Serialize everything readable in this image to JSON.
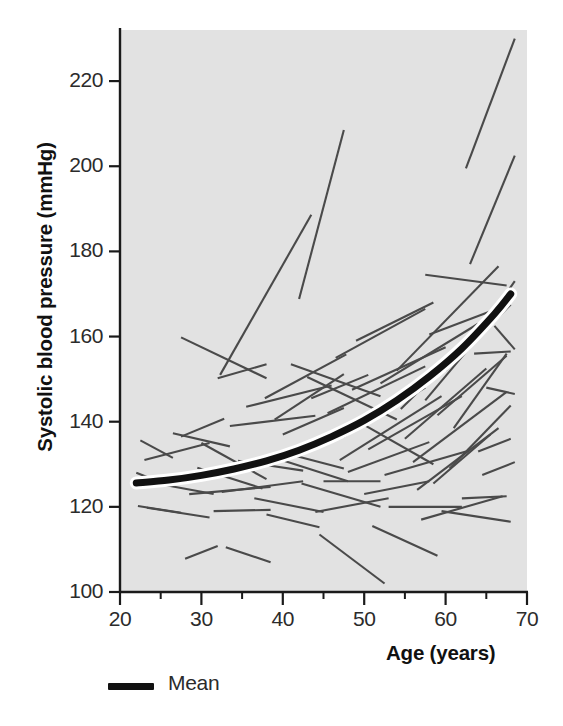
{
  "chart_data": {
    "type": "line",
    "title": "",
    "subtitle": "",
    "xlabel": "Age (years)",
    "ylabel": "Systolic blood pressure (mmHg)",
    "xlim": [
      20,
      70
    ],
    "ylim": [
      100,
      232
    ],
    "xticks": [
      20,
      30,
      40,
      50,
      60,
      70
    ],
    "xminorticks": [
      25,
      35,
      45,
      55,
      65
    ],
    "yticks": [
      100,
      120,
      140,
      160,
      180,
      200,
      220
    ],
    "grid": false,
    "legend": {
      "position": "below-left",
      "entries": [
        {
          "name": "Mean",
          "style": "thick-black-line",
          "color": "#111111"
        }
      ]
    },
    "plot_background": "#e2e2e2",
    "series_color": "#4a4a4a",
    "mean_color": "#111111",
    "mean_halo_color": "#ffffff",
    "series_description": "Individual subject systolic blood pressure trajectories (spaghetti plot), each a straight segment from first to last observation",
    "mean": {
      "name": "Mean",
      "x": [
        22,
        26,
        30,
        34,
        38,
        42,
        46,
        50,
        54,
        58,
        62,
        66,
        68
      ],
      "y": [
        125.6,
        126.3,
        127.4,
        128.9,
        130.8,
        133.3,
        136.5,
        140.3,
        145.0,
        150.6,
        157.2,
        165.3,
        170.0
      ]
    },
    "subjects": [
      {
        "x": [
          22.0,
          26.0
        ],
        "y": [
          128.0,
          125.0
        ]
      },
      {
        "x": [
          22.2,
          27.5
        ],
        "y": [
          120.2,
          118.6
        ]
      },
      {
        "x": [
          22.5,
          26.5
        ],
        "y": [
          135.6,
          131.5
        ]
      },
      {
        "x": [
          23.0,
          31.0
        ],
        "y": [
          131.0,
          135.0
        ]
      },
      {
        "x": [
          23.3,
          31.0
        ],
        "y": [
          119.8,
          117.5
        ]
      },
      {
        "x": [
          24.5,
          31.5
        ],
        "y": [
          125.5,
          123.0
        ]
      },
      {
        "x": [
          26.5,
          33.5
        ],
        "y": [
          137.3,
          134.2
        ]
      },
      {
        "x": [
          27.5,
          38.0
        ],
        "y": [
          159.8,
          150.2
        ]
      },
      {
        "x": [
          27.5,
          32.8
        ],
        "y": [
          136.5,
          140.7
        ]
      },
      {
        "x": [
          28.0,
          32.0
        ],
        "y": [
          107.8,
          110.8
        ]
      },
      {
        "x": [
          28.5,
          38.5
        ],
        "y": [
          123.0,
          124.7
        ]
      },
      {
        "x": [
          29.5,
          37.5
        ],
        "y": [
          129.2,
          124.3
        ]
      },
      {
        "x": [
          30.0,
          38.0
        ],
        "y": [
          135.0,
          126.5
        ]
      },
      {
        "x": [
          31.5,
          38.5
        ],
        "y": [
          119.0,
          119.3
        ]
      },
      {
        "x": [
          32.0,
          38.0
        ],
        "y": [
          150.2,
          153.5
        ]
      },
      {
        "x": [
          32.3,
          43.5
        ],
        "y": [
          151.0,
          188.6
        ]
      },
      {
        "x": [
          32.5,
          42.5
        ],
        "y": [
          123.5,
          126.0
        ]
      },
      {
        "x": [
          33.0,
          38.5
        ],
        "y": [
          110.5,
          107.0
        ]
      },
      {
        "x": [
          33.5,
          44.0
        ],
        "y": [
          139.0,
          141.4
        ]
      },
      {
        "x": [
          34.5,
          42.5
        ],
        "y": [
          130.8,
          128.5
        ]
      },
      {
        "x": [
          35.5,
          46.0
        ],
        "y": [
          143.5,
          148.5
        ]
      },
      {
        "x": [
          36.5,
          45.0
        ],
        "y": [
          122.0,
          118.8
        ]
      },
      {
        "x": [
          37.8,
          47.8
        ],
        "y": [
          145.5,
          155.8
        ]
      },
      {
        "x": [
          38.0,
          44.5
        ],
        "y": [
          118.2,
          115.2
        ]
      },
      {
        "x": [
          38.5,
          48.0
        ],
        "y": [
          131.8,
          126.0
        ]
      },
      {
        "x": [
          39.0,
          47.5
        ],
        "y": [
          140.5,
          151.2
        ]
      },
      {
        "x": [
          40.0,
          47.5
        ],
        "y": [
          137.0,
          143.2
        ]
      },
      {
        "x": [
          41.0,
          52.0
        ],
        "y": [
          153.5,
          146.0
        ]
      },
      {
        "x": [
          41.5,
          47.5
        ],
        "y": [
          132.0,
          129.0
        ]
      },
      {
        "x": [
          42.0,
          47.5
        ],
        "y": [
          168.8,
          208.5
        ]
      },
      {
        "x": [
          42.3,
          52.0
        ],
        "y": [
          125.5,
          120.0
        ]
      },
      {
        "x": [
          43.0,
          54.0
        ],
        "y": [
          150.5,
          140.5
        ]
      },
      {
        "x": [
          43.5,
          50.5
        ],
        "y": [
          145.5,
          151.0
        ]
      },
      {
        "x": [
          44.0,
          53.0
        ],
        "y": [
          118.8,
          122.0
        ]
      },
      {
        "x": [
          44.5,
          52.5
        ],
        "y": [
          113.5,
          102.0
        ]
      },
      {
        "x": [
          45.0,
          52.0
        ],
        "y": [
          126.0,
          126.0
        ]
      },
      {
        "x": [
          45.5,
          57.5
        ],
        "y": [
          142.0,
          153.0
        ]
      },
      {
        "x": [
          46.5,
          57.5
        ],
        "y": [
          155.0,
          166.5
        ]
      },
      {
        "x": [
          47.0,
          59.5
        ],
        "y": [
          131.0,
          146.0
        ]
      },
      {
        "x": [
          47.5,
          57.5
        ],
        "y": [
          136.5,
          148.0
        ]
      },
      {
        "x": [
          48.0,
          58.0
        ],
        "y": [
          128.2,
          135.2
        ]
      },
      {
        "x": [
          48.5,
          60.0
        ],
        "y": [
          147.5,
          157.5
        ]
      },
      {
        "x": [
          49.0,
          58.5
        ],
        "y": [
          159.0,
          168.0
        ]
      },
      {
        "x": [
          49.5,
          58.5
        ],
        "y": [
          139.8,
          130.0
        ]
      },
      {
        "x": [
          50.0,
          58.0
        ],
        "y": [
          123.0,
          126.0
        ]
      },
      {
        "x": [
          50.5,
          62.0
        ],
        "y": [
          133.5,
          146.0
        ]
      },
      {
        "x": [
          51.0,
          59.0
        ],
        "y": [
          115.5,
          108.5
        ]
      },
      {
        "x": [
          52.0,
          64.0
        ],
        "y": [
          149.0,
          163.0
        ]
      },
      {
        "x": [
          52.5,
          62.5
        ],
        "y": [
          127.5,
          133.0
        ]
      },
      {
        "x": [
          53.0,
          62.0
        ],
        "y": [
          120.0,
          120.0
        ]
      },
      {
        "x": [
          54.0,
          66.5
        ],
        "y": [
          152.0,
          176.5
        ]
      },
      {
        "x": [
          54.5,
          64.0
        ],
        "y": [
          143.0,
          161.0
        ]
      },
      {
        "x": [
          55.0,
          65.0
        ],
        "y": [
          136.0,
          152.5
        ]
      },
      {
        "x": [
          56.0,
          67.5
        ],
        "y": [
          130.5,
          147.0
        ]
      },
      {
        "x": [
          56.5,
          66.5
        ],
        "y": [
          124.0,
          138.5
        ]
      },
      {
        "x": [
          57.0,
          67.0
        ],
        "y": [
          117.0,
          122.5
        ]
      },
      {
        "x": [
          57.5,
          67.5
        ],
        "y": [
          174.5,
          172.0
        ]
      },
      {
        "x": [
          57.5,
          63.0
        ],
        "y": [
          145.0,
          157.5
        ]
      },
      {
        "x": [
          58.0,
          67.0
        ],
        "y": [
          160.5,
          167.0
        ]
      },
      {
        "x": [
          58.5,
          65.5
        ],
        "y": [
          125.5,
          137.0
        ]
      },
      {
        "x": [
          59.0,
          67.5
        ],
        "y": [
          141.5,
          155.5
        ]
      },
      {
        "x": [
          59.5,
          68.0
        ],
        "y": [
          119.0,
          116.5
        ]
      },
      {
        "x": [
          60.0,
          68.0
        ],
        "y": [
          152.0,
          167.5
        ]
      },
      {
        "x": [
          60.5,
          68.0
        ],
        "y": [
          129.0,
          143.8
        ]
      },
      {
        "x": [
          61.0,
          67.5
        ],
        "y": [
          138.5,
          156.0
        ]
      },
      {
        "x": [
          62.0,
          67.5
        ],
        "y": [
          122.0,
          122.5
        ]
      },
      {
        "x": [
          62.5,
          68.5
        ],
        "y": [
          199.5,
          230.0
        ]
      },
      {
        "x": [
          63.0,
          68.5
        ],
        "y": [
          177.0,
          202.5
        ]
      },
      {
        "x": [
          63.5,
          68.0
        ],
        "y": [
          156.0,
          156.5
        ]
      },
      {
        "x": [
          64.0,
          68.0
        ],
        "y": [
          133.0,
          136.0
        ]
      },
      {
        "x": [
          64.5,
          68.5
        ],
        "y": [
          127.5,
          130.5
        ]
      },
      {
        "x": [
          65.0,
          68.5
        ],
        "y": [
          148.0,
          146.5
        ]
      },
      {
        "x": [
          66.0,
          68.5
        ],
        "y": [
          162.5,
          157.0
        ]
      },
      {
        "x": [
          66.5,
          68.5
        ],
        "y": [
          167.5,
          173.0
        ]
      }
    ]
  },
  "axis": {
    "y_tick_labels": [
      "220",
      "200",
      "180",
      "160",
      "140",
      "120",
      "100"
    ],
    "x_tick_labels": [
      "20",
      "30",
      "40",
      "50",
      "60",
      "70"
    ],
    "y_title": "Systolic blood pressure (mmHg)",
    "x_title": "Age (years)"
  },
  "legend": {
    "mean_label": "Mean"
  }
}
